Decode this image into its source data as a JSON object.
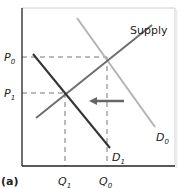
{
  "diagram": {
    "panel_label": "(a)",
    "curves": {
      "supply": {
        "label": "Supply",
        "color": "#6e6e6e"
      },
      "d0": {
        "label_main": "D",
        "label_sub": "0",
        "color": "#b3b3b3"
      },
      "d1": {
        "label_main": "D",
        "label_sub": "1",
        "color": "#333333"
      }
    },
    "y_axis": {
      "ticks": [
        {
          "main": "P",
          "sub": "0"
        },
        {
          "main": "P",
          "sub": "1"
        }
      ]
    },
    "x_axis": {
      "ticks": [
        {
          "main": "Q",
          "sub": "1"
        },
        {
          "main": "Q",
          "sub": "0"
        }
      ]
    },
    "shift_arrow": {
      "direction": "left",
      "color": "#666666"
    }
  }
}
